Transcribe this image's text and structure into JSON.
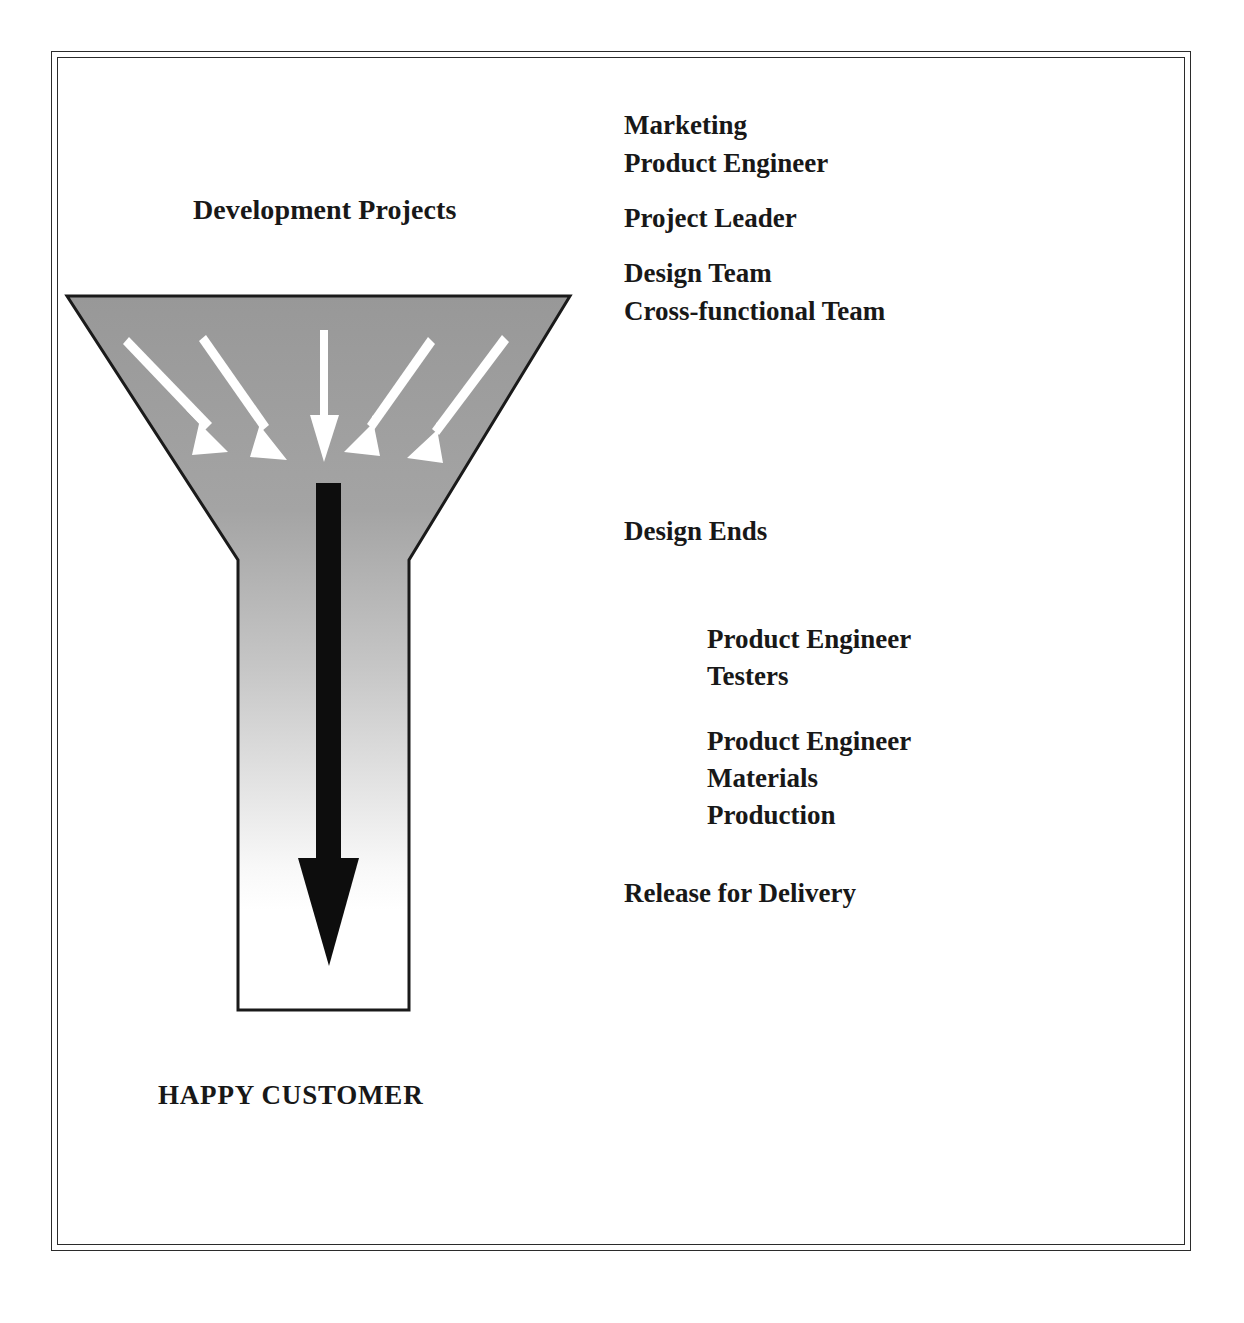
{
  "figure": {
    "type": "funnel-diagram",
    "title": "Development Projects",
    "outcome_label": "HAPPY CUSTOMER",
    "funnel": {
      "fill_top_color": "#9b9b9b",
      "fill_bottom_color": "#ffffff",
      "outline_color": "#1a1a1a",
      "inflow_arrow_color": "#ffffff",
      "inflow_arrow_count": 5,
      "outflow_arrow_color": "#0d0d0d"
    },
    "frame_color": "#2b2b2b",
    "background_color": "#ffffff"
  },
  "stages": {
    "inputs": {
      "group_a": [
        "Marketing",
        "Product Engineer"
      ],
      "group_b": [
        "Project Leader"
      ],
      "group_c": [
        "Design Team",
        "Cross-functional Team"
      ]
    },
    "milestone_design_ends": "Design Ends",
    "downstream": {
      "group_a": [
        "Product Engineer",
        "Testers"
      ],
      "group_b": [
        "Product Engineer",
        "Materials",
        "Production"
      ]
    },
    "milestone_release": "Release for Delivery"
  }
}
